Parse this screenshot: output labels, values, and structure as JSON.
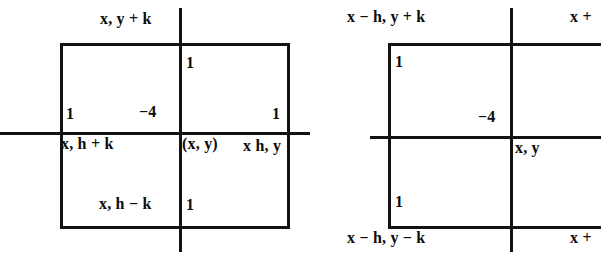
{
  "figure": {
    "background_color": "#ffffff",
    "ink_color": "#121212",
    "panel_count": 2
  },
  "left_diagram": {
    "name": "left-stencil",
    "center_label": "(x, y)",
    "top_label": "x, y + k",
    "left_label": "x, h + k",
    "right_label": "x h, y",
    "bottom_label": "x, h − k",
    "center_coefficient": "−4",
    "coefficients": {
      "top": "1",
      "left": "1",
      "right": "1",
      "bottom": "1"
    }
  },
  "right_diagram": {
    "name": "right-stencil",
    "center_label": "x, y",
    "top_left_label": "x − h, y + k",
    "top_right_label": "x +",
    "bottom_left_label": "x − h, y − k",
    "bottom_right_label": "x +",
    "center_coefficient": "−4",
    "coefficients": {
      "top_left": "1",
      "bottom_left": "1"
    }
  }
}
